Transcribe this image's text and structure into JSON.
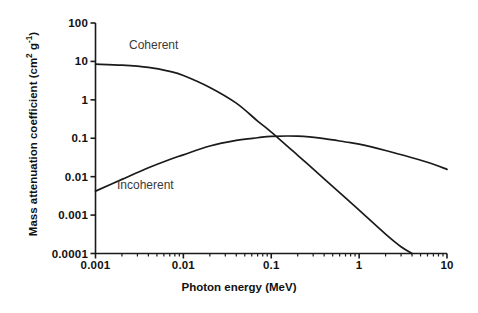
{
  "chart_data": {
    "type": "line",
    "title": "",
    "xlabel": "Photon energy (MeV)",
    "ylabel": "Mass attenuation coefficient (cm² g⁻¹)",
    "xscale": "log",
    "yscale": "log",
    "xlim": [
      0.001,
      10
    ],
    "ylim": [
      0.0001,
      100
    ],
    "grid": false,
    "legend_position": "inline-annotations",
    "xticks": [
      "0.001",
      "0.01",
      "0.1",
      "1",
      "10"
    ],
    "xtick_values": [
      0.001,
      0.01,
      0.1,
      1,
      10
    ],
    "yticks": [
      "100",
      "10",
      "1",
      "0.1",
      "0.01",
      "0.001",
      "0.0001"
    ],
    "ytick_values": [
      100,
      10,
      1,
      0.1,
      0.01,
      0.001,
      0.0001
    ],
    "series": [
      {
        "name": "Coherent",
        "label": "Coherent",
        "color": "#1a1a1a",
        "x": [
          0.001,
          0.002,
          0.004,
          0.007,
          0.01,
          0.02,
          0.04,
          0.07,
          0.1,
          0.2,
          0.4,
          0.7,
          1.0,
          2.0,
          3.0,
          4.0
        ],
        "y": [
          8.5,
          8.0,
          7.0,
          5.5,
          4.3,
          2.1,
          0.82,
          0.28,
          0.145,
          0.036,
          0.0088,
          0.0028,
          0.00135,
          0.00032,
          0.00015,
          0.0001
        ]
      },
      {
        "name": "Incoherent",
        "label": "Incoherent",
        "color": "#1a1a1a",
        "x": [
          0.001,
          0.002,
          0.004,
          0.007,
          0.01,
          0.02,
          0.04,
          0.07,
          0.1,
          0.2,
          0.4,
          0.7,
          1.0,
          2.0,
          4.0,
          7.0,
          10.0
        ],
        "y": [
          0.0042,
          0.0085,
          0.017,
          0.028,
          0.037,
          0.063,
          0.088,
          0.103,
          0.112,
          0.113,
          0.098,
          0.08,
          0.07,
          0.048,
          0.031,
          0.021,
          0.0155
        ]
      }
    ],
    "annotations": [
      {
        "text": "Coherent",
        "x": 0.0042,
        "y": 24
      },
      {
        "text": "Incoherent",
        "x": 0.0032,
        "y": 0.0075
      }
    ]
  },
  "axes": {
    "x_title": "Photon energy (MeV)",
    "y_title_main": "Mass attenuation coefficient (cm",
    "y_title_sup1": "2",
    "y_title_mid": " g",
    "y_title_sup2": "-1",
    "y_title_end": ")"
  },
  "colors": {
    "axis": "#1a1a1a",
    "curve": "#1a1a1a",
    "background": "#ffffff",
    "label_text": "#3a3a3a"
  }
}
